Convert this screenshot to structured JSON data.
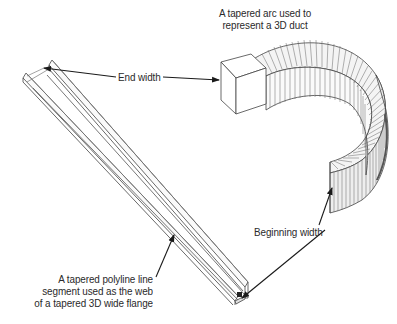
{
  "diagram": {
    "annotations": {
      "arc_caption": {
        "line1": "A tapered arc used to",
        "line2": "represent a 3D duct"
      },
      "end_width": "End width",
      "beginning_width": "Beginning width",
      "polyline_caption": {
        "line1": "A tapered polyline line",
        "line2": "segment used as the web",
        "line3": "of a tapered 3D wide flange"
      }
    },
    "objects": [
      {
        "name": "tapered 3D duct",
        "shape": "tapered arc"
      },
      {
        "name": "tapered 3D wide flange",
        "shape": "tapered polyline"
      }
    ],
    "colors": {
      "line": "#3a3a3a",
      "arrow": "#1a1a1a",
      "background": "#ffffff"
    }
  }
}
